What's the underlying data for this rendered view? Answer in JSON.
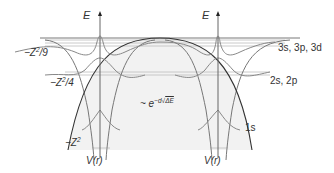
{
  "diagram": {
    "axes": [
      {
        "id": "left",
        "top_label": "E",
        "bottom_label": "V(r)"
      },
      {
        "id": "right",
        "top_label": "E",
        "bottom_label": "V(r)"
      }
    ],
    "energy_levels_left": [
      {
        "label_base": "−Z",
        "label_sup": "2",
        "label_tail": "/9"
      },
      {
        "label_base": "−Z",
        "label_sup": "2",
        "label_tail": "/4"
      },
      {
        "label_base": "−Z",
        "label_sup": "2",
        "label_tail": ""
      }
    ],
    "state_labels_right": [
      "3s, 3p, 3d",
      "2s, 2p",
      "1s"
    ],
    "tunneling_annotation": {
      "prefix": "~ e",
      "exponent": "−d",
      "sqrt_content": "ΔE"
    },
    "colors": {
      "curve": "#7a7a7a",
      "barrier": "#333333",
      "level_line": "#b5b5b5",
      "shade": "#f1f1f1",
      "text": "#333333"
    }
  }
}
